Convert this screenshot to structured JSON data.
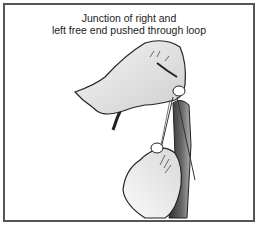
{
  "figure": {
    "caption_lines": [
      "Junction of right and",
      "left free end pushed through loop"
    ],
    "illustration": "hands-tying-tie-knot-illustration",
    "colors": {
      "border": "#555555",
      "skin": "#e6e6e6",
      "outline": "#222222",
      "tie_dark": "#3a3a3a",
      "tie_light": "#9a9a9a"
    }
  }
}
